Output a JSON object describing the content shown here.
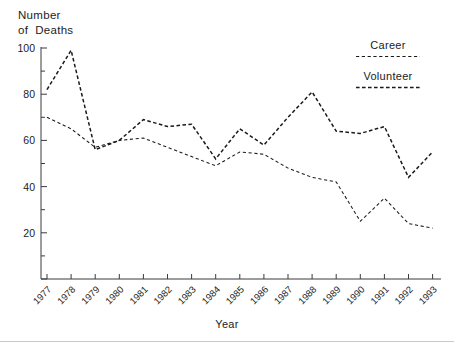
{
  "chart_data": {
    "type": "line",
    "title": "",
    "ylabel_line1": "Number",
    "ylabel_line2": "of  Deaths",
    "xlabel": "Year",
    "categories": [
      "1977",
      "1978",
      "1979",
      "1980",
      "1981",
      "1982",
      "1983",
      "1984",
      "1985",
      "1986",
      "1987",
      "1988",
      "1989",
      "1990",
      "1991",
      "1992",
      "1993"
    ],
    "x": [
      1977,
      1978,
      1979,
      1980,
      1981,
      1982,
      1983,
      1984,
      1985,
      1986,
      1987,
      1988,
      1989,
      1990,
      1991,
      1992,
      1993
    ],
    "series": [
      {
        "name": "Career",
        "values": [
          70,
          65,
          57,
          60,
          61,
          57,
          53,
          49,
          55,
          54,
          48,
          44,
          42,
          25,
          35,
          24,
          22
        ]
      },
      {
        "name": "Volunteer",
        "values": [
          82,
          99,
          56,
          60,
          69,
          66,
          67,
          52,
          65,
          58,
          70,
          81,
          64,
          63,
          66,
          44,
          55
        ]
      }
    ],
    "ylim": [
      0,
      100
    ],
    "yticks": [
      0,
      20,
      40,
      60,
      80,
      100
    ],
    "ytick_labels": [
      "",
      "20",
      "40",
      "60",
      "80",
      "100"
    ],
    "yticks_minor": [
      10,
      30,
      50,
      70,
      90
    ],
    "grid": false,
    "legend_position": "top-right",
    "xtick_rotation_deg": 45,
    "colors": {
      "axis": "#3a3a3a",
      "series": "#1a1a1a",
      "background": "#ffffff"
    }
  },
  "legend": {
    "entries": [
      {
        "label": "Career",
        "dash": "fine"
      },
      {
        "label": "Volunteer",
        "dash": "bold"
      }
    ]
  }
}
